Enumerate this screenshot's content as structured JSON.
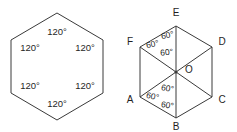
{
  "figure": {
    "background_color": "#ffffff",
    "stroke_color": "#3a3a3a",
    "text_color": "#1f1f1f",
    "left_diagram": {
      "name": "regular-hexagon-interior-angles",
      "shape": "hexagon",
      "orientation": "pointy-top",
      "angle_labels": [
        "120°",
        "120°",
        "120°",
        "120°",
        "120°",
        "120°"
      ]
    },
    "right_diagram": {
      "name": "hexagon-abcdef-with-center-o",
      "shape": "hexagon",
      "orientation": "flat-sides-left-right",
      "vertex_labels": {
        "top": "E",
        "upper_right": "D",
        "lower_right": "C",
        "bottom": "B",
        "lower_left": "A",
        "upper_left": "F"
      },
      "center_label": "O",
      "diagonals": [
        "E–B",
        "F–C",
        "A–D"
      ],
      "angle_labels": [
        "60°",
        "60°",
        "60°",
        "60°",
        "60°",
        "60°"
      ]
    }
  }
}
